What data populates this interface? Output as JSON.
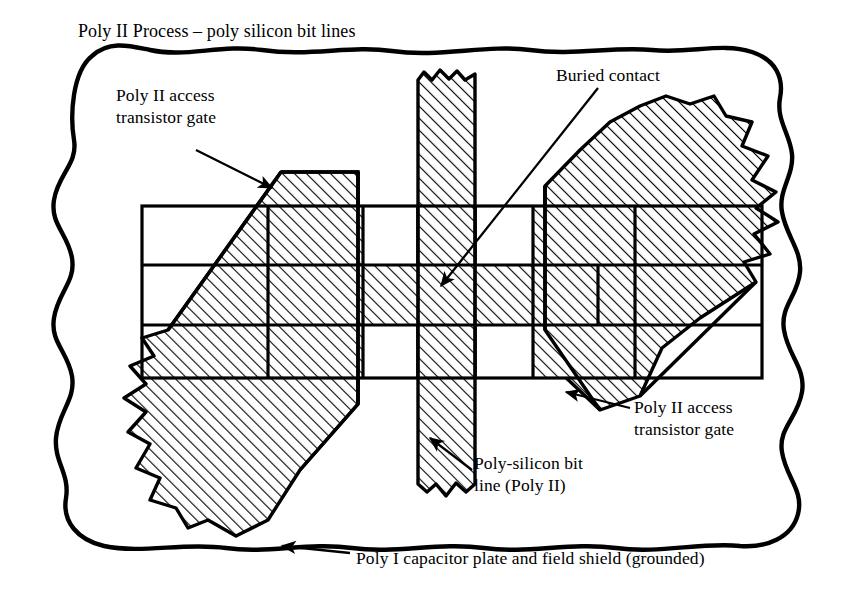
{
  "figure": {
    "title": "Poly II Process – poly silicon bit lines",
    "caption": "Poly I capacitor plate and field shield (grounded)",
    "type": "ic-layout-cross-section",
    "background_color": "#ffffff",
    "ink_color": "#000000",
    "hatch": {
      "angle_degrees": 45,
      "spacing_px": 6,
      "line_width_px": 1.6,
      "color": "#000000"
    }
  },
  "labels": {
    "gate_left": {
      "line1": "Poly II access",
      "line2": "transistor gate"
    },
    "buried_contact": {
      "line1": "Buried contact"
    },
    "gate_right": {
      "line1": "Poly II access",
      "line2": "transistor gate"
    },
    "bit_line": {
      "line1": "Poly-silicon bit",
      "line2": "line (Poly II)"
    },
    "poly1_shield": {
      "line1": "Poly I capacitor plate and field shield (grounded)"
    }
  },
  "regions": {
    "outer_boundary": "Poly I capacitor plate and field shield (grounded)",
    "diagonal_band_left": "Poly II access transistor gate",
    "diagonal_band_right": "Poly II access transistor gate",
    "vertical_stripe": "Poly-silicon bit line (Poly II)",
    "center_cell": "Buried contact"
  },
  "arrows": [
    {
      "name": "arrow-gate-left",
      "from": [
        196,
        150
      ],
      "to": [
        274,
        190
      ],
      "direction": "down-right"
    },
    {
      "name": "arrow-buried",
      "from": [
        596,
        86
      ],
      "to": [
        438,
        288
      ],
      "direction": "down-left"
    },
    {
      "name": "arrow-gate-right",
      "from": [
        628,
        408
      ],
      "to": [
        566,
        392
      ],
      "direction": "left"
    },
    {
      "name": "arrow-bitline",
      "from": [
        472,
        470
      ],
      "to": [
        428,
        438
      ],
      "direction": "up-left"
    },
    {
      "name": "arrow-poly1",
      "from": [
        348,
        554
      ],
      "to": [
        282,
        546
      ],
      "direction": "left"
    }
  ]
}
